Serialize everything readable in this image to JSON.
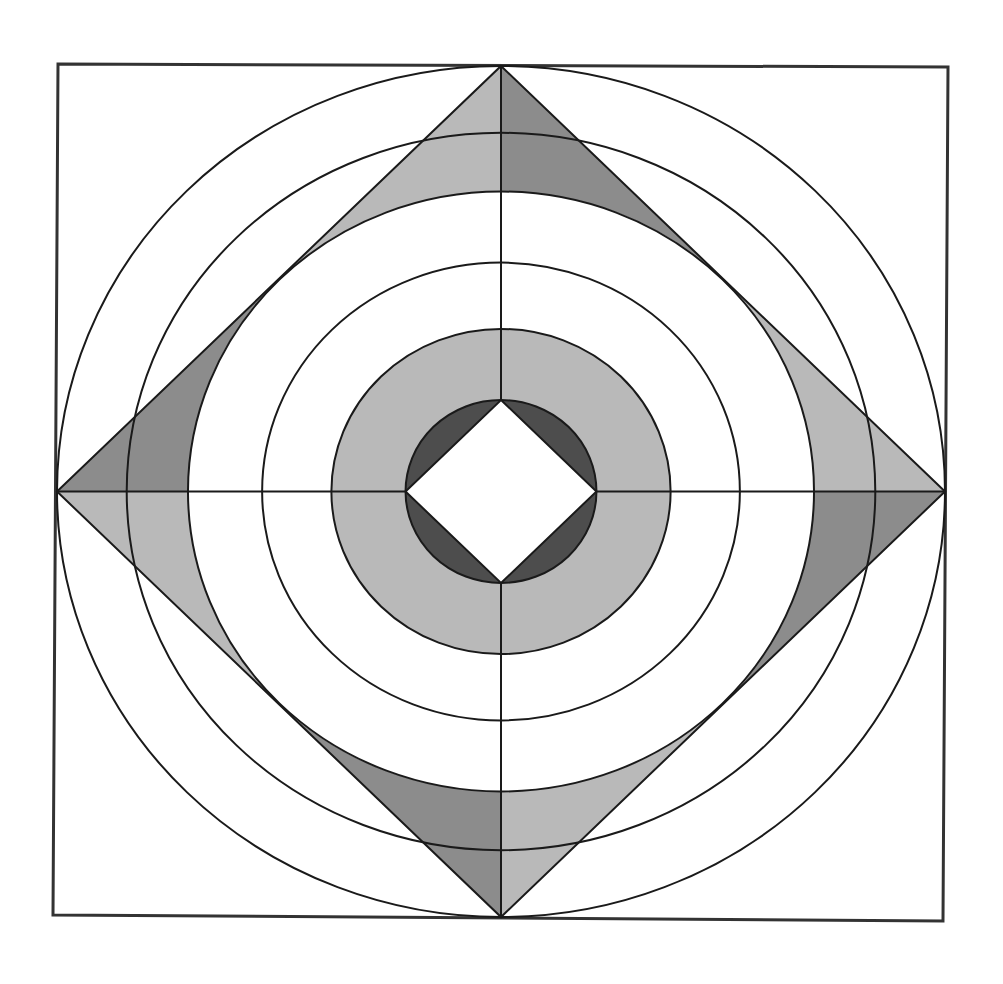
{
  "figure": {
    "colors": {
      "background": "#ffffff",
      "line": "#1a1a1a",
      "frame": "#333333",
      "light_fill": "#b9b9b9",
      "medium_fill": "#8c8c8c",
      "dark_fill": "#4d4d4d",
      "hole_fill": "#ffffff"
    },
    "elements": {
      "frame": "square frame",
      "circle_count": 6,
      "outer_diamond": "diamond inscribed in outer circle",
      "inner_diamond": "diamond inscribed in innermost circle",
      "axes": [
        "horizontal axis",
        "vertical axis"
      ]
    },
    "shading": {
      "outer_diamond_segments": [
        {
          "vertex": "top",
          "side": "left",
          "tone": "light"
        },
        {
          "vertex": "top",
          "side": "right",
          "tone": "medium"
        },
        {
          "vertex": "right",
          "side": "upper",
          "tone": "light"
        },
        {
          "vertex": "right",
          "side": "lower",
          "tone": "medium"
        },
        {
          "vertex": "bottom",
          "side": "right",
          "tone": "light"
        },
        {
          "vertex": "bottom",
          "side": "left",
          "tone": "medium"
        },
        {
          "vertex": "left",
          "side": "lower",
          "tone": "light"
        },
        {
          "vertex": "left",
          "side": "upper",
          "tone": "medium"
        }
      ],
      "middle_annulus": "light",
      "inner_crescents": "dark",
      "inner_diamond": "hole"
    }
  }
}
